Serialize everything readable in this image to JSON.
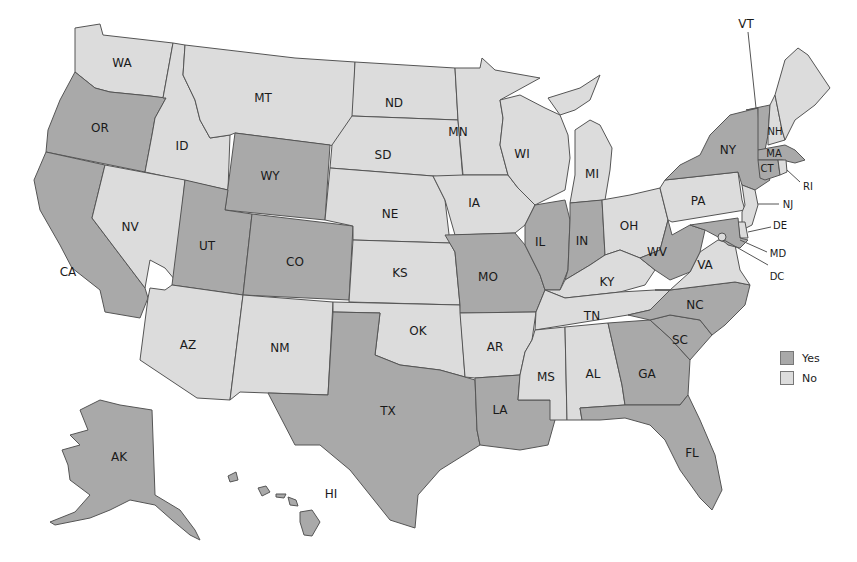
{
  "map": {
    "type": "choropleth",
    "region": "United States",
    "colors": {
      "yes": "#a9a9a9",
      "no": "#dcdcdc",
      "border": "#555555"
    },
    "legend": [
      {
        "key": "yes",
        "label": "Yes",
        "color": "#a9a9a9"
      },
      {
        "key": "no",
        "label": "No",
        "color": "#dcdcdc"
      }
    ],
    "states": {
      "WA": "No",
      "OR": "Yes",
      "CA": "Yes",
      "ID": "No",
      "NV": "No",
      "MT": "No",
      "WY": "Yes",
      "UT": "Yes",
      "CO": "Yes",
      "AZ": "No",
      "NM": "No",
      "ND": "No",
      "SD": "No",
      "NE": "No",
      "KS": "No",
      "OK": "No",
      "TX": "Yes",
      "MN": "No",
      "IA": "No",
      "MO": "Yes",
      "AR": "No",
      "LA": "Yes",
      "WI": "No",
      "IL": "Yes",
      "MI": "No",
      "IN": "Yes",
      "OH": "No",
      "KY": "No",
      "TN": "No",
      "MS": "No",
      "AL": "No",
      "GA": "Yes",
      "FL": "Yes",
      "SC": "Yes",
      "NC": "Yes",
      "VA": "No",
      "WV": "Yes",
      "PA": "No",
      "NY": "Yes",
      "VT": "Yes",
      "NH": "No",
      "ME": "No",
      "MA": "Yes",
      "RI": "No",
      "CT": "Yes",
      "NJ": "No",
      "DE": "No",
      "MD": "Yes",
      "DC": "No",
      "AK": "Yes",
      "HI": "Yes"
    },
    "labels": {
      "WA": "WA",
      "OR": "OR",
      "CA": "CA",
      "ID": "ID",
      "NV": "NV",
      "MT": "MT",
      "WY": "WY",
      "UT": "UT",
      "CO": "CO",
      "AZ": "AZ",
      "NM": "NM",
      "ND": "ND",
      "SD": "SD",
      "NE": "NE",
      "KS": "KS",
      "OK": "OK",
      "TX": "TX",
      "MN": "MN",
      "IA": "IA",
      "MO": "MO",
      "AR": "AR",
      "LA": "LA",
      "WI": "WI",
      "IL": "IL",
      "MI": "MI",
      "IN": "IN",
      "OH": "OH",
      "KY": "KY",
      "TN": "TN",
      "MS": "MS",
      "AL": "AL",
      "GA": "GA",
      "FL": "FL",
      "SC": "SC",
      "NC": "NC",
      "VA": "VA",
      "WV": "WV",
      "PA": "PA",
      "NY": "NY",
      "VT": "VT",
      "NH": "NH",
      "MA": "MA",
      "RI": "RI",
      "CT": "CT",
      "NJ": "NJ",
      "DE": "DE",
      "MD": "MD",
      "DC": "DC",
      "AK": "AK",
      "HI": "HI"
    }
  }
}
